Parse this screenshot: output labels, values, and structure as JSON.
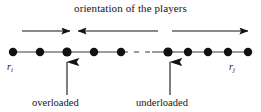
{
  "figure": {
    "width": 261,
    "height": 112,
    "background_color": "#ffffff",
    "ink_color": "#141414",
    "title": "orientation of the players"
  },
  "axis": {
    "left_label": "r",
    "left_subscript": "i",
    "right_label": "r",
    "right_subscript": "j",
    "line_y": 52,
    "line_start_x": 13,
    "line_end_x": 248,
    "ellipsis_start_x": 112,
    "ellipsis_end_x": 152
  },
  "nodes": {
    "radius": 4.2,
    "left_group_x": [
      13,
      40,
      67,
      94,
      121
    ],
    "right_group_x": [
      168,
      188,
      208,
      228,
      248
    ],
    "count_left": 5,
    "count_right": 5
  },
  "orientation_arrows": [
    {
      "name": "arrow-right-first",
      "direction": "right",
      "x_start": 22,
      "x_end": 70,
      "y": 31
    },
    {
      "name": "arrow-left-middle",
      "direction": "left",
      "x_start": 158,
      "x_end": 78,
      "y": 31
    },
    {
      "name": "arrow-right-last",
      "direction": "right",
      "x_start": 172,
      "x_end": 248,
      "y": 31
    }
  ],
  "pointer_arrows": [
    {
      "name": "pointer-overloaded",
      "x": 67,
      "y_base": 95,
      "y_tip": 61,
      "label": "overloaded"
    },
    {
      "name": "pointer-underloaded",
      "x": 170,
      "y_base": 95,
      "y_tip": 61,
      "label": "underloaded"
    }
  ],
  "annotations": {
    "overloaded": "overloaded",
    "underloaded": "underloaded"
  }
}
